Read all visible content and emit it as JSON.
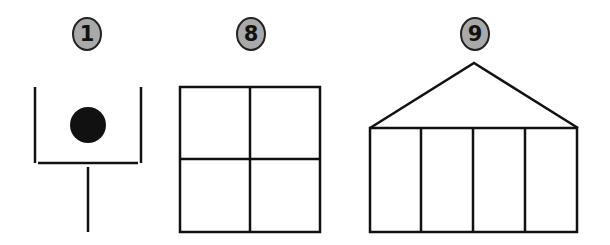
{
  "figures": [
    {
      "id": "figure-1",
      "label": "1",
      "description": "open-top box with a filled dot and a stem below"
    },
    {
      "id": "figure-8",
      "label": "8",
      "description": "square divided into four equal squares"
    },
    {
      "id": "figure-9",
      "label": "9",
      "description": "house shape: triangular roof over rectangle split into four columns"
    }
  ],
  "colors": {
    "badge_fill": "#a9a9a9",
    "stroke": "#111111",
    "dot": "#111111",
    "background": "#ffffff"
  }
}
